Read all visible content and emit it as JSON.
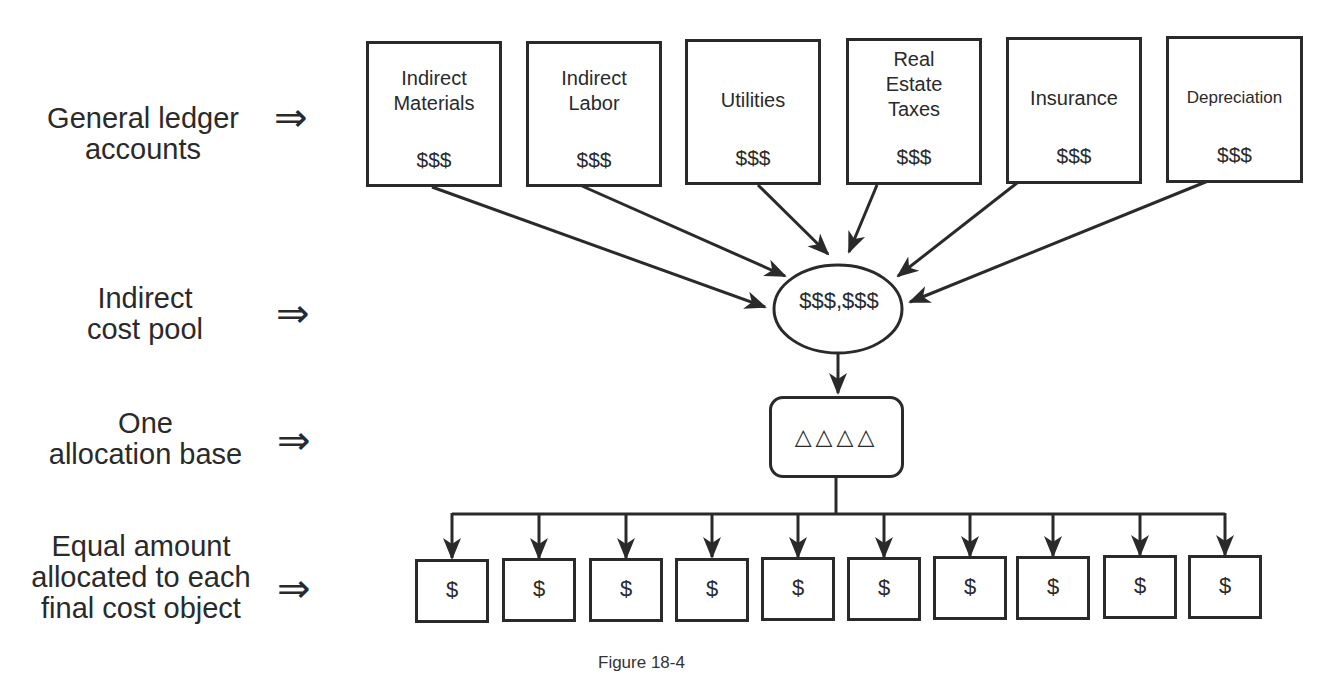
{
  "row_labels": {
    "ledger": {
      "line1": "General ledger",
      "line2": "accounts"
    },
    "pool": {
      "line1": "Indirect",
      "line2": "cost pool"
    },
    "base": {
      "line1": "One",
      "line2": "allocation base"
    },
    "allocated": {
      "line1": "Equal amount",
      "line2": "allocated to each",
      "line3": "final cost object"
    },
    "implies_symbol": "⇒"
  },
  "accounts": [
    {
      "name_line1": "Indirect",
      "name_line2": "Materials",
      "name_line3": "",
      "amount": "$$$"
    },
    {
      "name_line1": "Indirect",
      "name_line2": "Labor",
      "name_line3": "",
      "amount": "$$$"
    },
    {
      "name_line1": "Utilities",
      "name_line2": "",
      "name_line3": "",
      "amount": "$$$"
    },
    {
      "name_line1": "Real",
      "name_line2": "Estate",
      "name_line3": "Taxes",
      "amount": "$$$"
    },
    {
      "name_line1": "Insurance",
      "name_line2": "",
      "name_line3": "",
      "amount": "$$$"
    },
    {
      "name_line1": "Depreciation",
      "name_line2": "",
      "name_line3": "",
      "amount": "$$$"
    }
  ],
  "cost_pool": {
    "amount": "$$$,$$$"
  },
  "allocation_base": {
    "symbol": "△△△△"
  },
  "cost_objects": [
    "$",
    "$",
    "$",
    "$",
    "$",
    "$",
    "$",
    "$",
    "$",
    "$"
  ],
  "caption": "Figure 18-4"
}
